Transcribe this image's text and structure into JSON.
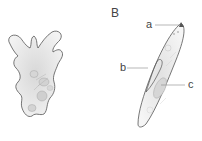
{
  "figure": {
    "panel_b_label": "B",
    "labels": {
      "a": "a",
      "b": "b",
      "c": "c"
    }
  },
  "colors": {
    "outline": "#555555",
    "fill": "#efefef",
    "leader": "#888888",
    "label": "#444444"
  }
}
